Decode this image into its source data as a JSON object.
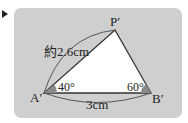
{
  "figure": {
    "vertices": {
      "A": "A′",
      "B": "B′",
      "P": "P′"
    },
    "angles": {
      "A": "40°",
      "B": "60°"
    },
    "lengths": {
      "AP": "約2.6cm",
      "AB": "3cm"
    },
    "colors": {
      "panel": "#cfcfcf",
      "triangle_fill": "#ffffff",
      "stroke": "#333333",
      "angle_mark": "#8a8a8a",
      "arc": "#555555"
    }
  }
}
